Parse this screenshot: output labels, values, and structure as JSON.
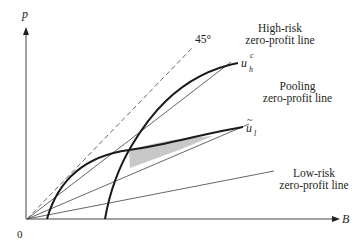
{
  "diagram": {
    "axes": {
      "y_label": "p",
      "x_label": "B",
      "origin_label": "0"
    },
    "lines": [
      {
        "id": "45deg",
        "label": "45°",
        "style": "dashed"
      },
      {
        "id": "high_risk",
        "label_line1": "High-risk",
        "label_line2": "zero-profit line",
        "style": "solid-thin"
      },
      {
        "id": "pooling",
        "label_line1": "Pooling",
        "label_line2": "zero-profit line",
        "style": "solid-thin"
      },
      {
        "id": "low_risk",
        "label_line1": "Low-risk",
        "label_line2": "zero-profit line",
        "style": "solid-thin"
      }
    ],
    "curves": [
      {
        "id": "u_h_c",
        "base": "u",
        "subscript": "h",
        "superscript": "c",
        "style": "solid-thick"
      },
      {
        "id": "u_l_tilde",
        "base": "u",
        "subscript": "l",
        "accent": "~",
        "style": "solid-thick"
      }
    ],
    "shaded_region": {
      "fill": "#c8c8c8",
      "between": [
        "u_l_tilde",
        "pooling"
      ]
    },
    "colors": {
      "line": "#231f20",
      "thin_line": "#555555",
      "shade": "#c8c8c8"
    }
  }
}
